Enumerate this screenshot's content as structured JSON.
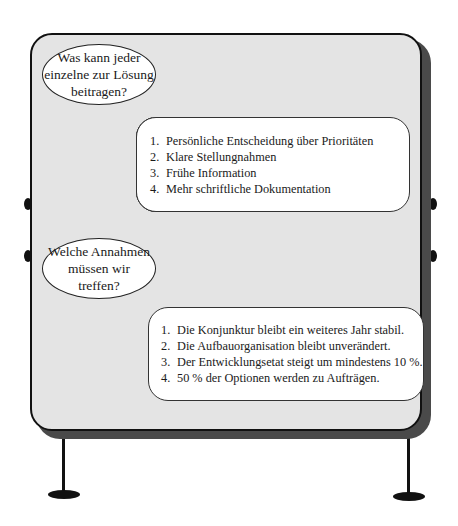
{
  "board": {
    "colors": {
      "surface": "#e4e4e4",
      "border": "#111111",
      "shadow": "#4a4a4a",
      "card": "#ffffff"
    }
  },
  "section1": {
    "question": "Was kann jeder\neinzelne zur Lösung\nbeitragen?",
    "items": [
      {
        "num": "1.",
        "text": "Persönliche Entscheidung über Prioritäten"
      },
      {
        "num": "2.",
        "text": "Klare Stellungnahmen"
      },
      {
        "num": "3.",
        "text": "Frühe Information"
      },
      {
        "num": "4.",
        "text": "Mehr schriftliche Dokumentation"
      }
    ]
  },
  "section2": {
    "question": "Welche Annahmen\nmüssen wir\ntreffen?",
    "items": [
      {
        "num": "1.",
        "text": "Die Konjunktur bleibt ein weiteres Jahr stabil."
      },
      {
        "num": "2.",
        "text": "Die Aufbauorganisation bleibt unverändert."
      },
      {
        "num": "3.",
        "text": "Der Entwicklungsetat steigt um mindestens 10 %."
      },
      {
        "num": "4.",
        "text": "50 % der Optionen werden zu Aufträgen."
      }
    ]
  }
}
